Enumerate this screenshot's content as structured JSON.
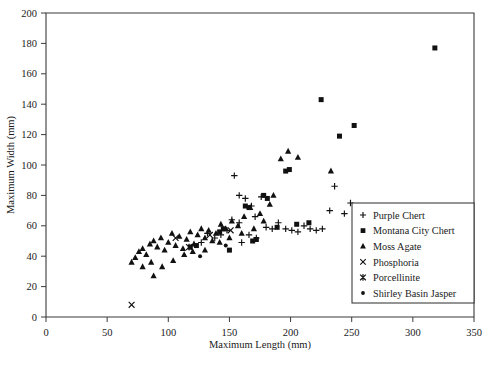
{
  "chart_data": {
    "type": "scatter",
    "title": "",
    "xlabel": "Maximum Length (mm)",
    "ylabel": "Maximum Width (mm)",
    "xlim": [
      0,
      350
    ],
    "ylim": [
      0,
      200
    ],
    "xticks": [
      0,
      50,
      100,
      150,
      200,
      250,
      300,
      350
    ],
    "yticks": [
      0,
      20,
      40,
      60,
      80,
      100,
      120,
      140,
      160,
      180,
      200
    ],
    "grid": false,
    "legend_position": "right-middle",
    "series": [
      {
        "name": "Purple Chert",
        "marker": "plus",
        "points": [
          [
            154,
            93
          ],
          [
            158,
            80
          ],
          [
            163,
            78
          ],
          [
            168,
            73
          ],
          [
            171,
            66
          ],
          [
            176,
            79
          ],
          [
            180,
            59
          ],
          [
            185,
            58
          ],
          [
            190,
            62
          ],
          [
            196,
            58
          ],
          [
            201,
            57
          ],
          [
            206,
            56
          ],
          [
            211,
            60
          ],
          [
            216,
            58
          ],
          [
            221,
            57
          ],
          [
            226,
            58
          ],
          [
            232,
            70
          ],
          [
            236,
            86
          ],
          [
            244,
            68
          ],
          [
            249,
            75
          ],
          [
            160,
            49
          ],
          [
            166,
            54
          ],
          [
            172,
            52
          ],
          [
            158,
            62
          ],
          [
            152,
            64
          ],
          [
            148,
            57
          ],
          [
            143,
            54
          ],
          [
            138,
            52
          ],
          [
            132,
            55
          ],
          [
            127,
            49
          ]
        ]
      },
      {
        "name": "Montana City Chert",
        "marker": "square",
        "points": [
          [
            318,
            177
          ],
          [
            252,
            126
          ],
          [
            240,
            119
          ],
          [
            225,
            143
          ],
          [
            196,
            96
          ],
          [
            199,
            97
          ],
          [
            163,
            73
          ],
          [
            166,
            72
          ],
          [
            178,
            80
          ],
          [
            181,
            78
          ],
          [
            145,
            58
          ],
          [
            142,
            56
          ],
          [
            123,
            47
          ],
          [
            118,
            46
          ],
          [
            205,
            61
          ],
          [
            172,
            51
          ],
          [
            169,
            50
          ],
          [
            150,
            44
          ],
          [
            189,
            59
          ],
          [
            215,
            62
          ]
        ]
      },
      {
        "name": "Moss Agate",
        "marker": "triangle",
        "points": [
          [
            70,
            36
          ],
          [
            73,
            39
          ],
          [
            76,
            43
          ],
          [
            79,
            45
          ],
          [
            82,
            41
          ],
          [
            85,
            48
          ],
          [
            88,
            50
          ],
          [
            91,
            46
          ],
          [
            94,
            52
          ],
          [
            97,
            44
          ],
          [
            100,
            49
          ],
          [
            103,
            55
          ],
          [
            106,
            47
          ],
          [
            109,
            53
          ],
          [
            112,
            45
          ],
          [
            115,
            51
          ],
          [
            118,
            56
          ],
          [
            121,
            48
          ],
          [
            124,
            54
          ],
          [
            127,
            58
          ],
          [
            130,
            52
          ],
          [
            133,
            57
          ],
          [
            136,
            50
          ],
          [
            139,
            55
          ],
          [
            143,
            61
          ],
          [
            147,
            58
          ],
          [
            152,
            63
          ],
          [
            157,
            60
          ],
          [
            162,
            66
          ],
          [
            167,
            72
          ],
          [
            175,
            68
          ],
          [
            183,
            74
          ],
          [
            192,
            104
          ],
          [
            198,
            109
          ],
          [
            206,
            105
          ],
          [
            88,
            27
          ],
          [
            95,
            33
          ],
          [
            104,
            37
          ],
          [
            113,
            41
          ],
          [
            86,
            36
          ],
          [
            79,
            33
          ],
          [
            120,
            43
          ],
          [
            130,
            44
          ],
          [
            142,
            49
          ],
          [
            150,
            52
          ],
          [
            160,
            55
          ],
          [
            170,
            58
          ],
          [
            178,
            63
          ],
          [
            186,
            80
          ],
          [
            233,
            96
          ]
        ]
      },
      {
        "name": "Phosphoria",
        "marker": "x",
        "points": [
          [
            70,
            8
          ],
          [
            106,
            52
          ],
          [
            134,
            54
          ],
          [
            151,
            57
          ]
        ]
      },
      {
        "name": "Porcellinite",
        "marker": "star",
        "points": [
          [
            117,
            46
          ]
        ]
      },
      {
        "name": "Shirley Basin Jasper",
        "marker": "dot",
        "points": [
          [
            126,
            40
          ],
          [
            147,
            47
          ]
        ]
      }
    ]
  },
  "legend": {
    "entries": [
      {
        "label": "Purple Chert",
        "marker": "plus"
      },
      {
        "label": "Montana City Chert",
        "marker": "square"
      },
      {
        "label": "Moss Agate",
        "marker": "triangle"
      },
      {
        "label": "Phosphoria",
        "marker": "x"
      },
      {
        "label": "Porcellinite",
        "marker": "star"
      },
      {
        "label": "Shirley Basin Jasper",
        "marker": "dot"
      }
    ]
  },
  "colors": {
    "marker": "#111111",
    "axis": "#3a3a3a",
    "background": "#ffffff"
  }
}
